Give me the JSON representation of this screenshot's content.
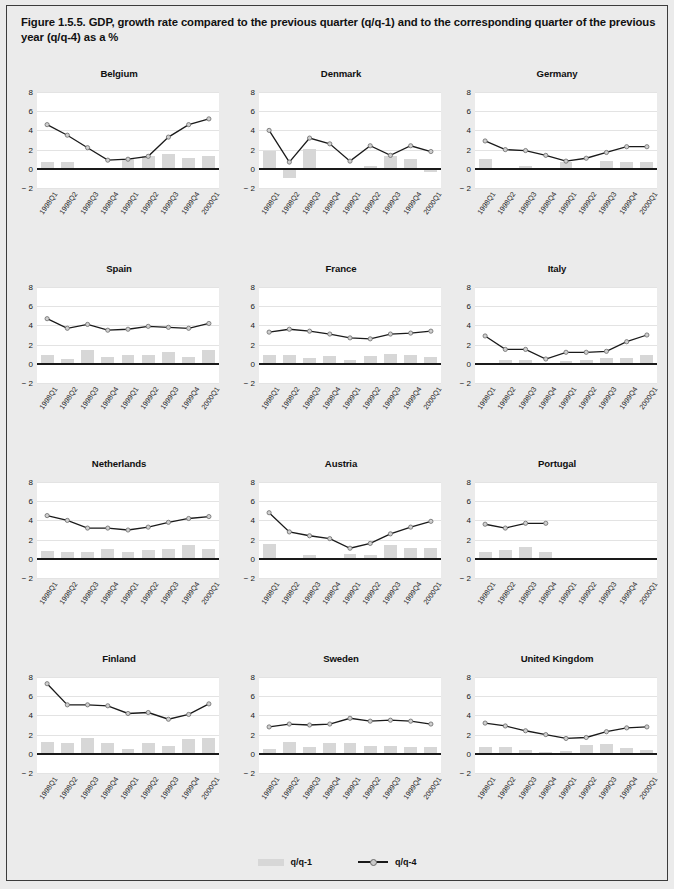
{
  "figure": {
    "title": "Figure 1.5.5. GDP, growth rate compared to the previous quarter (q/q-1) and to the corresponding quarter of the previous year (q/q-4) as a %"
  },
  "legend": {
    "items": [
      {
        "label": "q/q-1",
        "type": "bar",
        "color": "#d7d7d7"
      },
      {
        "label": "q/q-4",
        "type": "line",
        "color": "#1a1a1a"
      }
    ]
  },
  "axis": {
    "yticks": [
      8,
      6,
      4,
      2,
      0,
      -2
    ],
    "ytick_labels": [
      "8",
      "6",
      "4",
      "2",
      "0",
      "− 2"
    ],
    "ylim": [
      -2,
      8
    ],
    "categories": [
      "1998Q1",
      "1998Q2",
      "1998Q3",
      "1998Q4",
      "1999Q1",
      "1999Q2",
      "1999Q3",
      "1999Q4",
      "2000Q1"
    ]
  },
  "chart_data": {
    "type": "bar",
    "title": "Figure 1.5.5. GDP, growth rate compared to the previous quarter (q/q-1) and to the corresponding quarter of the previous year (q/q-4) as a %",
    "xlabel": "",
    "ylabel": "",
    "ylim": [
      -2,
      8
    ],
    "grid": true,
    "legend_position": "bottom-center",
    "categories": [
      "1998Q1",
      "1998Q2",
      "1998Q3",
      "1998Q4",
      "1999Q1",
      "1999Q2",
      "1999Q3",
      "1999Q4",
      "2000Q1"
    ],
    "panels": [
      {
        "name": "Belgium",
        "series": [
          {
            "name": "q/q-1",
            "type": "bar",
            "values": [
              0.7,
              0.7,
              -0.1,
              0.0,
              1.0,
              1.3,
              1.5,
              1.1,
              1.3
            ]
          },
          {
            "name": "q/q-4",
            "type": "line",
            "values": [
              4.6,
              3.5,
              2.2,
              0.9,
              1.0,
              1.3,
              3.3,
              4.6,
              5.2
            ]
          }
        ]
      },
      {
        "name": "Denmark",
        "series": [
          {
            "name": "q/q-1",
            "type": "bar",
            "values": [
              1.9,
              -1.0,
              2.1,
              0.0,
              0.0,
              0.3,
              1.3,
              1.0,
              -0.3
            ]
          },
          {
            "name": "q/q-4",
            "type": "line",
            "values": [
              4.0,
              0.7,
              3.2,
              2.6,
              0.8,
              2.4,
              1.4,
              2.4,
              1.8
            ]
          }
        ]
      },
      {
        "name": "Germany",
        "series": [
          {
            "name": "q/q-1",
            "type": "bar",
            "values": [
              1.0,
              0.0,
              0.3,
              0.0,
              0.7,
              0.0,
              0.8,
              0.7,
              0.7
            ]
          },
          {
            "name": "q/q-4",
            "type": "line",
            "values": [
              2.9,
              2.0,
              1.9,
              1.4,
              0.8,
              1.1,
              1.7,
              2.3,
              2.3
            ]
          }
        ]
      },
      {
        "name": "Spain",
        "series": [
          {
            "name": "q/q-1",
            "type": "bar",
            "values": [
              0.9,
              0.5,
              1.4,
              0.7,
              0.9,
              0.9,
              1.2,
              0.7,
              1.4
            ]
          },
          {
            "name": "q/q-4",
            "type": "line",
            "values": [
              4.7,
              3.7,
              4.1,
              3.5,
              3.6,
              3.9,
              3.8,
              3.7,
              4.2
            ]
          }
        ]
      },
      {
        "name": "France",
        "series": [
          {
            "name": "q/q-1",
            "type": "bar",
            "values": [
              0.9,
              0.9,
              0.6,
              0.8,
              0.4,
              0.8,
              1.0,
              0.9,
              0.7
            ]
          },
          {
            "name": "q/q-4",
            "type": "line",
            "values": [
              3.3,
              3.6,
              3.4,
              3.1,
              2.7,
              2.6,
              3.1,
              3.2,
              3.4
            ]
          }
        ]
      },
      {
        "name": "Italy",
        "series": [
          {
            "name": "q/q-1",
            "type": "bar",
            "values": [
              0.0,
              0.4,
              0.4,
              0.0,
              0.3,
              0.4,
              0.6,
              0.6,
              0.9
            ]
          },
          {
            "name": "q/q-4",
            "type": "line",
            "values": [
              2.9,
              1.5,
              1.5,
              0.5,
              1.2,
              1.2,
              1.3,
              2.3,
              3.0
            ]
          }
        ]
      },
      {
        "name": "Netherlands",
        "series": [
          {
            "name": "q/q-1",
            "type": "bar",
            "values": [
              0.8,
              0.7,
              0.7,
              1.0,
              0.7,
              0.9,
              1.0,
              1.4,
              1.0
            ]
          },
          {
            "name": "q/q-4",
            "type": "line",
            "values": [
              4.5,
              4.0,
              3.2,
              3.2,
              3.0,
              3.3,
              3.8,
              4.2,
              4.4
            ]
          }
        ]
      },
      {
        "name": "Austria",
        "series": [
          {
            "name": "q/q-1",
            "type": "bar",
            "values": [
              1.5,
              0.0,
              0.4,
              0.0,
              0.5,
              0.4,
              1.4,
              1.1,
              1.1
            ]
          },
          {
            "name": "q/q-4",
            "type": "line",
            "values": [
              4.8,
              2.8,
              2.4,
              2.1,
              1.1,
              1.6,
              2.6,
              3.3,
              3.9
            ]
          }
        ]
      },
      {
        "name": "Portugal",
        "series": [
          {
            "name": "q/q-1",
            "type": "bar",
            "values": [
              0.7,
              0.9,
              1.2,
              0.7,
              null,
              null,
              null,
              null,
              null
            ]
          },
          {
            "name": "q/q-4",
            "type": "line",
            "values": [
              3.6,
              3.2,
              3.7,
              3.7,
              null,
              null,
              null,
              null,
              null
            ]
          }
        ]
      },
      {
        "name": "Finland",
        "series": [
          {
            "name": "q/q-1",
            "type": "bar",
            "values": [
              1.2,
              1.1,
              1.6,
              1.1,
              0.5,
              1.1,
              0.8,
              1.5,
              1.6
            ]
          },
          {
            "name": "q/q-4",
            "type": "line",
            "values": [
              7.3,
              5.1,
              5.1,
              5.0,
              4.2,
              4.3,
              3.6,
              4.1,
              5.2
            ]
          }
        ]
      },
      {
        "name": "Sweden",
        "series": [
          {
            "name": "q/q-1",
            "type": "bar",
            "values": [
              0.5,
              1.2,
              0.7,
              1.1,
              1.1,
              0.8,
              0.8,
              0.7,
              0.7
            ]
          },
          {
            "name": "q/q-4",
            "type": "line",
            "values": [
              2.8,
              3.1,
              3.0,
              3.1,
              3.7,
              3.4,
              3.5,
              3.4,
              3.1
            ]
          }
        ]
      },
      {
        "name": "United Kingdom",
        "series": [
          {
            "name": "q/q-1",
            "type": "bar",
            "values": [
              0.7,
              0.7,
              0.4,
              0.2,
              0.3,
              0.9,
              1.0,
              0.6,
              0.4
            ]
          },
          {
            "name": "q/q-4",
            "type": "line",
            "values": [
              3.2,
              2.9,
              2.4,
              2.0,
              1.6,
              1.7,
              2.3,
              2.7,
              2.8
            ]
          }
        ]
      }
    ]
  }
}
